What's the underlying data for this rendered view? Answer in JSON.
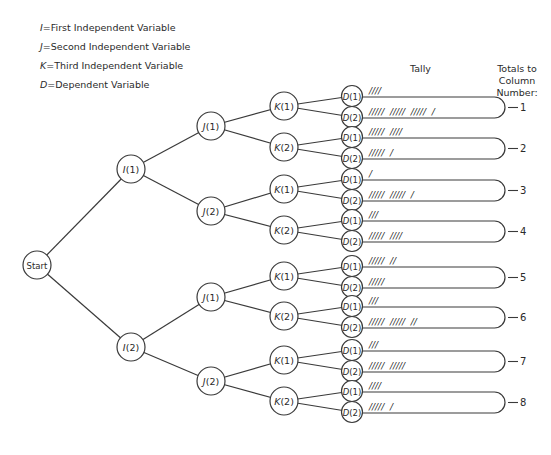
{
  "legend": [
    {
      "symbol": "I",
      "text": "First Independent Variable"
    },
    {
      "symbol": "J",
      "text": "Second Independent Variable"
    },
    {
      "symbol": "K",
      "text": "Third Independent Variable"
    },
    {
      "symbol": "D",
      "text": "Dependent Variable"
    }
  ],
  "headers": {
    "tally": "Tally",
    "totals": "Totals to Column Number:"
  },
  "tree": {
    "root": "Start",
    "level_i": [
      "I(1)",
      "I(2)"
    ],
    "level_j": [
      "J(1)",
      "J(2)",
      "J(1)",
      "J(2)"
    ],
    "level_k": [
      "K(1)",
      "K(2)",
      "K(1)",
      "K(2)",
      "K(1)",
      "K(2)",
      "K(1)",
      "K(2)"
    ],
    "level_d": [
      "D(1)",
      "D(2)"
    ]
  },
  "tallies": [
    {
      "column": "1",
      "d1": "////",
      "d2": "/////  /////  /////  /",
      "d1_count": 4,
      "d2_count": 16
    },
    {
      "column": "2",
      "d1": "/////  ////",
      "d2": "/////  /",
      "d1_count": 9,
      "d2_count": 6
    },
    {
      "column": "3",
      "d1": "/",
      "d2": "/////  /////  /",
      "d1_count": 1,
      "d2_count": 11
    },
    {
      "column": "4",
      "d1": "///",
      "d2": "/////  ////",
      "d1_count": 3,
      "d2_count": 9
    },
    {
      "column": "5",
      "d1": "/////  //",
      "d2": "/////",
      "d1_count": 7,
      "d2_count": 5
    },
    {
      "column": "6",
      "d1": "///",
      "d2": "/////  /////  //",
      "d1_count": 3,
      "d2_count": 12
    },
    {
      "column": "7",
      "d1": "///",
      "d2": "/////  /////",
      "d1_count": 3,
      "d2_count": 10
    },
    {
      "column": "8",
      "d1": "////",
      "d2": "/////  /",
      "d1_count": 4,
      "d2_count": 6
    }
  ]
}
